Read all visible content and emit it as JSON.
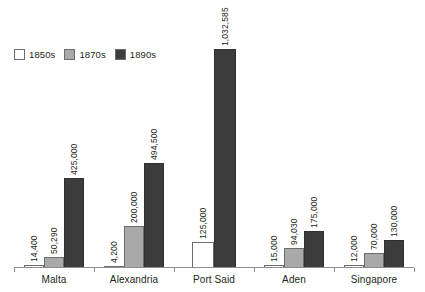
{
  "legend": {
    "position": "top-left",
    "entries": [
      {
        "label": "1850s",
        "color": "#ffffff"
      },
      {
        "label": "1870s",
        "color": "#a9a9a9"
      },
      {
        "label": "1890s",
        "color": "#3c3c3c"
      }
    ]
  },
  "chart_data": {
    "type": "bar",
    "title": "",
    "subtitle": "",
    "xlabel": "",
    "ylabel": "",
    "grid": false,
    "legend_position": "top-left",
    "ylim": [
      0,
      1200000
    ],
    "categories": [
      "Malta",
      "Alexandria",
      "Port Said",
      "Aden",
      "Singapore"
    ],
    "series": [
      {
        "name": "1850s",
        "color": "#ffffff",
        "values": [
          14400,
          4200,
          125000,
          15000,
          12000
        ],
        "labels": [
          "14,400",
          "4,200",
          "125,000",
          "15,000",
          "12,000"
        ]
      },
      {
        "name": "1870s",
        "color": "#a9a9a9",
        "values": [
          50290,
          200000,
          null,
          94030,
          70000
        ],
        "labels": [
          "50,290",
          "200,000",
          "",
          "94,030",
          "70,000"
        ]
      },
      {
        "name": "1890s",
        "color": "#3c3c3c",
        "values": [
          425000,
          494500,
          1032585,
          175000,
          130000
        ],
        "labels": [
          "425,000",
          "494,500",
          "1,032,585",
          "175,000",
          "130,000"
        ]
      }
    ]
  }
}
